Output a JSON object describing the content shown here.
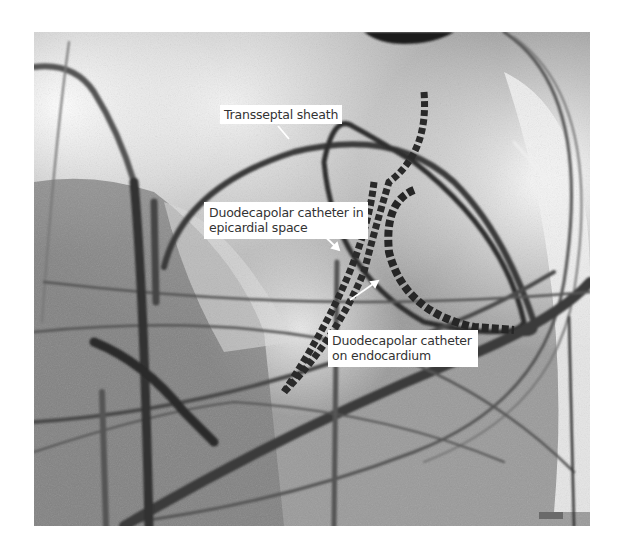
{
  "figure": {
    "type": "fluoroscopy-image",
    "colors": {
      "background": "#ffffff",
      "label_bg": "#ffffff",
      "label_text": "#333333",
      "catheter": "#2a2a2a"
    },
    "labels": [
      {
        "id": "transseptal-sheath",
        "lines": [
          "Transseptal sheath"
        ]
      },
      {
        "id": "epicardial",
        "lines": [
          "Duodecapolar catheter in",
          "epicardial space"
        ]
      },
      {
        "id": "endocardium",
        "lines": [
          "Duodecapolar catheter",
          "on endocardium"
        ]
      }
    ]
  }
}
